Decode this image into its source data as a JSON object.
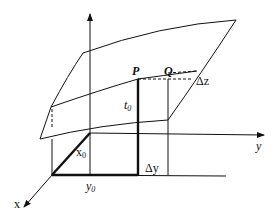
{
  "diagram": {
    "type": "3D surface increment diagram",
    "axes": {
      "x": "x",
      "y": "y"
    },
    "labels": {
      "P": "P",
      "Q": "Q",
      "delta_z": "Δz",
      "delta_y": "Δy",
      "t0": "t",
      "t0_sub": "0",
      "x0": "x",
      "x0_sub": "0",
      "y0": "y",
      "y0_sub": "0"
    }
  }
}
